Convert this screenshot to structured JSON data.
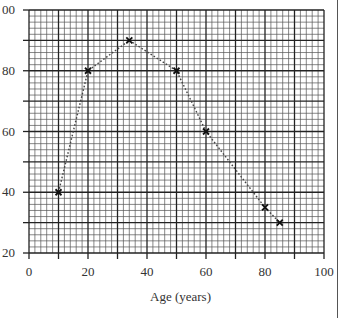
{
  "chart_data": {
    "type": "line",
    "title": "",
    "xlabel": "Age (years)",
    "ylabel": "",
    "xlim": [
      0,
      100
    ],
    "ylim": [
      20,
      100
    ],
    "x_ticks": [
      0,
      20,
      40,
      60,
      80,
      100
    ],
    "y_ticks": [
      20,
      40,
      60,
      80,
      100
    ],
    "x_tick_labels": [
      "0",
      "20",
      "40",
      "60",
      "80",
      "100"
    ],
    "y_tick_labels": [
      "20",
      "40",
      "60",
      "80",
      "00"
    ],
    "grid": {
      "on": true,
      "major_step": 10,
      "minor_step": 2
    },
    "line_style": "dotted",
    "marker": "x",
    "series": [
      {
        "name": "",
        "x": [
          10,
          20,
          34,
          50,
          60,
          80,
          85
        ],
        "y": [
          40,
          80,
          90,
          80,
          60,
          35,
          30
        ]
      }
    ],
    "colors": {
      "grid_major": "#222222",
      "grid_minor": "#555555",
      "line": "#444444",
      "marker": "#111111",
      "text": "#333333"
    }
  }
}
